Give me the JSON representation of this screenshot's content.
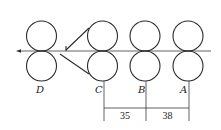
{
  "diagram": {
    "colors": {
      "line": "#2a2a2a",
      "text": "#222222",
      "background": "#ffffff"
    },
    "strip_line": {
      "y": 51,
      "x_start": 17,
      "x_end": 211,
      "arrow_direction": "left"
    },
    "roll_radius": 15,
    "stands": [
      {
        "label": "D",
        "cx": 41.5,
        "label_x": 39,
        "has_dim_line": false
      },
      {
        "label": "C",
        "cx": 102.5,
        "label_x": 97,
        "has_dim_line": true,
        "dim_x": 104
      },
      {
        "label": "B",
        "cx": 145,
        "label_x": 140,
        "has_dim_line": true,
        "dim_x": 146
      },
      {
        "label": "A",
        "cx": 188,
        "label_x": 182,
        "has_dim_line": true,
        "dim_x": 189
      }
    ],
    "dimensions": [
      {
        "from": "C",
        "to": "B",
        "value": "35"
      },
      {
        "from": "B",
        "to": "A",
        "value": "38"
      }
    ],
    "labels": {
      "D": "D",
      "C": "C",
      "B": "B",
      "A": "A",
      "dim_CB": "35",
      "dim_BA": "38"
    }
  }
}
